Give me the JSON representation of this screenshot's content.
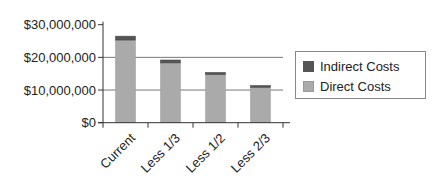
{
  "chart_data": {
    "type": "bar",
    "stacked": true,
    "title": "",
    "xlabel": "",
    "ylabel": "",
    "categories": [
      "Current",
      "Less 1/3",
      "Less 1/2",
      "Less 2/3"
    ],
    "series": [
      {
        "name": "Direct Costs",
        "color": "#aaaaaa",
        "values": [
          25300000,
          18300000,
          14700000,
          10800000
        ]
      },
      {
        "name": "Indirect Costs",
        "color": "#555555",
        "values": [
          1200000,
          900000,
          700000,
          600000
        ]
      }
    ],
    "ylim": [
      0,
      30000000
    ],
    "yticks": [
      0,
      10000000,
      20000000,
      30000000
    ],
    "ytick_labels": [
      "$0",
      "$10,000,000",
      "$20,000,000",
      "$30,000,000"
    ],
    "grid": {
      "horizontal": true,
      "lines_at": [
        10000000,
        20000000
      ]
    },
    "legend": {
      "position": "right",
      "entries": [
        "Indirect Costs",
        "Direct Costs"
      ]
    },
    "xtick_rotation": -45
  },
  "legend": {
    "items": [
      {
        "label": "Indirect Costs",
        "color": "#555555"
      },
      {
        "label": "Direct Costs",
        "color": "#aaaaaa"
      }
    ]
  },
  "axis": {
    "y_labels": [
      "$30,000,000",
      "$20,000,000",
      "$10,000,000",
      "$0"
    ],
    "x_labels": [
      "Current",
      "Less 1/3",
      "Less 1/2",
      "Less 2/3"
    ]
  }
}
